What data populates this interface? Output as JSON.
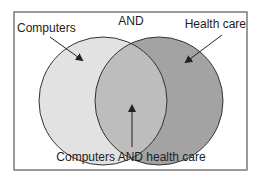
{
  "diagram": {
    "type": "venn",
    "operator_label": "AND",
    "sets": [
      {
        "id": "left",
        "label": "Computers",
        "fill": "#e2e2e2"
      },
      {
        "id": "right",
        "label": "Health care",
        "fill": "#a3a3a3"
      }
    ],
    "intersection": {
      "label": "Computers AND health care",
      "fill": "#bdbdbd"
    },
    "frame_color": "#666666",
    "stroke_color": "#333333"
  }
}
